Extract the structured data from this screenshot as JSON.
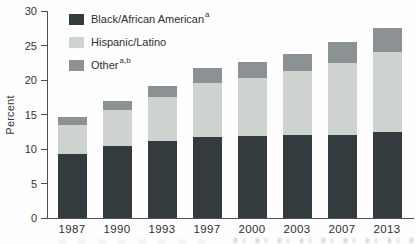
{
  "figure": {
    "ylabel": "Percent",
    "background_color": "#fefefe",
    "axis_color": "#4f4f4f",
    "text_color": "#323232"
  },
  "chart_data": {
    "type": "bar",
    "subtype": "stacked-vertical",
    "title": "",
    "xlabel": "",
    "ylabel": "Percent",
    "categories": [
      "1987",
      "1990",
      "1993",
      "1997",
      "2000",
      "2003",
      "2007",
      "2013"
    ],
    "series": [
      {
        "name": "Black/African American",
        "sup": "a",
        "color": "#343b3e",
        "values": [
          9.3,
          10.4,
          11.2,
          11.7,
          11.9,
          12.0,
          12.1,
          12.4
        ]
      },
      {
        "name": "Hispanic/Latino",
        "sup": "",
        "color": "#cfd3cf",
        "values": [
          4.2,
          5.3,
          6.4,
          7.9,
          8.4,
          9.3,
          10.3,
          11.6
        ]
      },
      {
        "name": "Other",
        "sup": "a,b",
        "color": "#8c9293",
        "values": [
          1.1,
          1.3,
          1.6,
          2.1,
          2.3,
          2.5,
          3.1,
          3.5
        ]
      }
    ],
    "totals": [
      14.6,
      17.0,
      19.2,
      21.7,
      22.6,
      23.8,
      25.5,
      27.5
    ],
    "ylim": [
      0,
      30
    ],
    "yticks": [
      0,
      5,
      10,
      15,
      20,
      25,
      30
    ],
    "grid": false,
    "legend_position": "top-left"
  }
}
